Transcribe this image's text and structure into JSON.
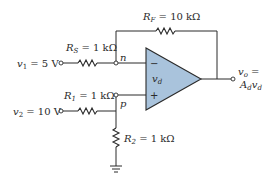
{
  "diagram": {
    "type": "op-amp difference amplifier circuit",
    "colors": {
      "opamp_fill": "#a9c3dc",
      "line": "#2a2a2a",
      "background": "#ffffff"
    },
    "components": {
      "rf": {
        "symbol": "R",
        "subscript": "F",
        "value": " = 10 kΩ"
      },
      "rs": {
        "symbol": "R",
        "subscript": "S",
        "value": " = 1 kΩ"
      },
      "r1": {
        "symbol": "R",
        "subscript": "1",
        "value": " = 1 kΩ"
      },
      "r2": {
        "symbol": "R",
        "subscript": "2",
        "value": " = 1 kΩ"
      }
    },
    "sources": {
      "v1": {
        "symbol": "v",
        "subscript": "1",
        "value": " = 5 V"
      },
      "v2": {
        "symbol": "v",
        "subscript": "2",
        "value": " = 10 V"
      }
    },
    "nodes": {
      "n": "n",
      "p": "p"
    },
    "opamp": {
      "inverting_sign": "−",
      "noninverting_sign": "+",
      "vd_symbol": "v",
      "vd_subscript": "d"
    },
    "output": {
      "line1_symbol": "v",
      "line1_subscript": "o",
      "line1_suffix": " =",
      "line2_gain": "A",
      "line2_gain_sub": "d",
      "line2_symbol": "v",
      "line2_subscript": "d"
    },
    "ground": {
      "label": "ground"
    }
  }
}
